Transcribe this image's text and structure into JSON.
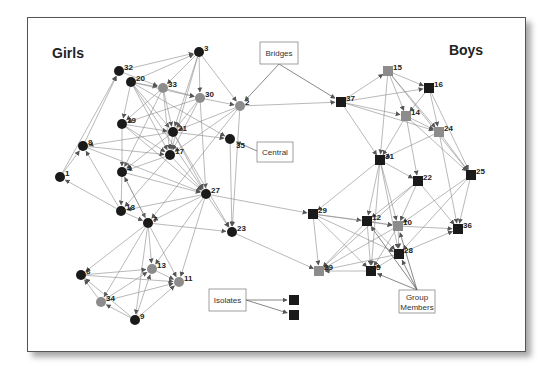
{
  "figure": {
    "groups": [
      {
        "id": "girls",
        "label": "Girls",
        "x": 68,
        "y": 58
      },
      {
        "id": "boys",
        "label": "Boys",
        "x": 466,
        "y": 55
      }
    ],
    "colors": {
      "member_dark": "#1a1a1a",
      "member_gray": "#8c8c8c",
      "edge": "#8a8a8a"
    },
    "legend_note": "Circles = girls, squares = boys; gray fill = group members",
    "nodes": [
      {
        "id": "3",
        "label": "3",
        "shape": "circle",
        "fill": "dark",
        "x": 199,
        "y": 52
      },
      {
        "id": "32",
        "label": "32",
        "shape": "circle",
        "fill": "dark",
        "x": 119,
        "y": 71
      },
      {
        "id": "20",
        "label": "20",
        "shape": "circle",
        "fill": "dark",
        "x": 131,
        "y": 82
      },
      {
        "id": "33",
        "label": "33",
        "shape": "circle",
        "fill": "gray",
        "x": 163,
        "y": 88
      },
      {
        "id": "30",
        "label": "30",
        "shape": "circle",
        "fill": "gray",
        "x": 200,
        "y": 98
      },
      {
        "id": "2",
        "label": "2",
        "shape": "circle",
        "fill": "gray",
        "x": 240,
        "y": 106
      },
      {
        "id": "19",
        "label": "19",
        "shape": "circle",
        "fill": "dark",
        "x": 122,
        "y": 124
      },
      {
        "id": "21",
        "label": "21",
        "shape": "circle",
        "fill": "dark",
        "x": 173,
        "y": 132
      },
      {
        "id": "35",
        "label": "35",
        "shape": "circle",
        "fill": "dark",
        "x": 230,
        "y": 139,
        "label_dx": 6,
        "label_dy": 10
      },
      {
        "id": "8",
        "label": "8",
        "shape": "circle",
        "fill": "dark",
        "x": 83,
        "y": 146
      },
      {
        "id": "17",
        "label": "17",
        "shape": "circle",
        "fill": "dark",
        "x": 170,
        "y": 155
      },
      {
        "id": "4",
        "label": "4",
        "shape": "circle",
        "fill": "dark",
        "x": 122,
        "y": 172
      },
      {
        "id": "1",
        "label": "1",
        "shape": "circle",
        "fill": "dark",
        "x": 60,
        "y": 177
      },
      {
        "id": "27",
        "label": "27",
        "shape": "circle",
        "fill": "dark",
        "x": 206,
        "y": 194
      },
      {
        "id": "18",
        "label": "18",
        "shape": "circle",
        "fill": "dark",
        "x": 121,
        "y": 211
      },
      {
        "id": "7",
        "label": "7",
        "shape": "circle",
        "fill": "dark",
        "x": 148,
        "y": 223
      },
      {
        "id": "23",
        "label": "23",
        "shape": "circle",
        "fill": "dark",
        "x": 232,
        "y": 232
      },
      {
        "id": "13",
        "label": "13",
        "shape": "circle",
        "fill": "gray",
        "x": 152,
        "y": 269
      },
      {
        "id": "6",
        "label": "6",
        "shape": "circle",
        "fill": "dark",
        "x": 81,
        "y": 275
      },
      {
        "id": "11",
        "label": "11",
        "shape": "circle",
        "fill": "gray",
        "x": 179,
        "y": 282
      },
      {
        "id": "34",
        "label": "34",
        "shape": "circle",
        "fill": "gray",
        "x": 101,
        "y": 302
      },
      {
        "id": "9",
        "label": "9",
        "shape": "circle",
        "fill": "dark",
        "x": 135,
        "y": 320
      },
      {
        "id": "15",
        "label": "15",
        "shape": "square",
        "fill": "gray",
        "x": 388,
        "y": 71
      },
      {
        "id": "16",
        "label": "16",
        "shape": "square",
        "fill": "dark",
        "x": 429,
        "y": 88
      },
      {
        "id": "37",
        "label": "37",
        "shape": "square",
        "fill": "dark",
        "x": 341,
        "y": 102
      },
      {
        "id": "14",
        "label": "14",
        "shape": "square",
        "fill": "gray",
        "x": 406,
        "y": 116
      },
      {
        "id": "24",
        "label": "24",
        "shape": "square",
        "fill": "gray",
        "x": 439,
        "y": 132
      },
      {
        "id": "31",
        "label": "31",
        "shape": "square",
        "fill": "dark",
        "x": 380,
        "y": 160
      },
      {
        "id": "25",
        "label": "25",
        "shape": "square",
        "fill": "dark",
        "x": 471,
        "y": 175
      },
      {
        "id": "22",
        "label": "22",
        "shape": "square",
        "fill": "dark",
        "x": 418,
        "y": 181
      },
      {
        "id": "29",
        "label": "29",
        "shape": "square",
        "fill": "dark",
        "x": 313,
        "y": 214
      },
      {
        "id": "12",
        "label": "12",
        "shape": "square",
        "fill": "dark",
        "x": 367,
        "y": 221
      },
      {
        "id": "10",
        "label": "10",
        "shape": "square",
        "fill": "gray",
        "x": 398,
        "y": 226
      },
      {
        "id": "36",
        "label": "36",
        "shape": "square",
        "fill": "dark",
        "x": 458,
        "y": 229
      },
      {
        "id": "28",
        "label": "28",
        "shape": "square",
        "fill": "dark",
        "x": 399,
        "y": 254
      },
      {
        "id": "29b",
        "label": "29",
        "shape": "square",
        "fill": "gray",
        "x": 319,
        "y": 271
      },
      {
        "id": "5",
        "label": "5",
        "shape": "square",
        "fill": "dark",
        "x": 371,
        "y": 271
      },
      {
        "id": "iso1",
        "label": "",
        "shape": "square",
        "fill": "dark",
        "x": 294,
        "y": 300
      },
      {
        "id": "iso2",
        "label": "",
        "shape": "square",
        "fill": "dark",
        "x": 294,
        "y": 315
      }
    ],
    "edges": [
      [
        "32",
        "3"
      ],
      [
        "20",
        "3"
      ],
      [
        "3",
        "33"
      ],
      [
        "3",
        "30"
      ],
      [
        "3",
        "2"
      ],
      [
        "3",
        "21"
      ],
      [
        "3",
        "17"
      ],
      [
        "20",
        "33"
      ],
      [
        "20",
        "30"
      ],
      [
        "32",
        "33"
      ],
      [
        "20",
        "21"
      ],
      [
        "20",
        "17"
      ],
      [
        "20",
        "19"
      ],
      [
        "20",
        "35"
      ],
      [
        "20",
        "27"
      ],
      [
        "33",
        "30"
      ],
      [
        "33",
        "21"
      ],
      [
        "33",
        "17"
      ],
      [
        "33",
        "19"
      ],
      [
        "33",
        "4"
      ],
      [
        "30",
        "21"
      ],
      [
        "30",
        "17"
      ],
      [
        "30",
        "2"
      ],
      [
        "30",
        "27"
      ],
      [
        "30",
        "19"
      ],
      [
        "2",
        "21"
      ],
      [
        "2",
        "17"
      ],
      [
        "2",
        "23"
      ],
      [
        "2",
        "37"
      ],
      [
        "2",
        "7"
      ],
      [
        "19",
        "21"
      ],
      [
        "19",
        "4"
      ],
      [
        "19",
        "27"
      ],
      [
        "19",
        "17"
      ],
      [
        "21",
        "17"
      ],
      [
        "21",
        "35"
      ],
      [
        "21",
        "27"
      ],
      [
        "21",
        "8"
      ],
      [
        "21",
        "4"
      ],
      [
        "21",
        "23"
      ],
      [
        "8",
        "32"
      ],
      [
        "1",
        "32"
      ],
      [
        "1",
        "8"
      ],
      [
        "8",
        "17"
      ],
      [
        "8",
        "27"
      ],
      [
        "18",
        "8"
      ],
      [
        "17",
        "4"
      ],
      [
        "17",
        "27"
      ],
      [
        "17",
        "18"
      ],
      [
        "4",
        "18"
      ],
      [
        "4",
        "27"
      ],
      [
        "4",
        "7"
      ],
      [
        "18",
        "1"
      ],
      [
        "18",
        "7"
      ],
      [
        "35",
        "23"
      ],
      [
        "27",
        "23"
      ],
      [
        "27",
        "7"
      ],
      [
        "27",
        "13"
      ],
      [
        "27",
        "11"
      ],
      [
        "27",
        "29"
      ],
      [
        "27",
        "18"
      ],
      [
        "7",
        "23"
      ],
      [
        "7",
        "13"
      ],
      [
        "7",
        "11"
      ],
      [
        "7",
        "6"
      ],
      [
        "7",
        "34"
      ],
      [
        "7",
        "9"
      ],
      [
        "7",
        "4"
      ],
      [
        "6",
        "13"
      ],
      [
        "6",
        "11"
      ],
      [
        "34",
        "13"
      ],
      [
        "34",
        "11"
      ],
      [
        "34",
        "6"
      ],
      [
        "9",
        "34"
      ],
      [
        "9",
        "13"
      ],
      [
        "9",
        "11"
      ],
      [
        "9",
        "6"
      ],
      [
        "13",
        "11"
      ],
      [
        "23",
        "29b"
      ],
      [
        "37",
        "15"
      ],
      [
        "37",
        "16"
      ],
      [
        "37",
        "14"
      ],
      [
        "37",
        "24"
      ],
      [
        "37",
        "31"
      ],
      [
        "15",
        "16"
      ],
      [
        "15",
        "14"
      ],
      [
        "15",
        "24"
      ],
      [
        "15",
        "31"
      ],
      [
        "15",
        "25"
      ],
      [
        "16",
        "14"
      ],
      [
        "16",
        "24"
      ],
      [
        "16",
        "25"
      ],
      [
        "14",
        "24"
      ],
      [
        "14",
        "31"
      ],
      [
        "14",
        "22"
      ],
      [
        "14",
        "25"
      ],
      [
        "24",
        "31"
      ],
      [
        "24",
        "25"
      ],
      [
        "24",
        "36"
      ],
      [
        "31",
        "22"
      ],
      [
        "31",
        "12"
      ],
      [
        "31",
        "10"
      ],
      [
        "31",
        "29"
      ],
      [
        "31",
        "5"
      ],
      [
        "31",
        "28"
      ],
      [
        "22",
        "10"
      ],
      [
        "22",
        "12"
      ],
      [
        "22",
        "36"
      ],
      [
        "22",
        "29b"
      ],
      [
        "25",
        "10"
      ],
      [
        "25",
        "28"
      ],
      [
        "25",
        "36"
      ],
      [
        "29",
        "12"
      ],
      [
        "29",
        "28"
      ],
      [
        "29",
        "5"
      ],
      [
        "29",
        "29b"
      ],
      [
        "29",
        "10"
      ],
      [
        "12",
        "10"
      ],
      [
        "12",
        "5"
      ],
      [
        "12",
        "29b"
      ],
      [
        "12",
        "28"
      ],
      [
        "10",
        "36"
      ],
      [
        "10",
        "5"
      ],
      [
        "10",
        "29b"
      ],
      [
        "10",
        "28"
      ],
      [
        "28",
        "36"
      ],
      [
        "28",
        "5"
      ],
      [
        "28",
        "29b"
      ],
      [
        "5",
        "29b"
      ]
    ],
    "callouts": [
      {
        "id": "bridges",
        "label": "Bridges",
        "x": 260,
        "y": 42,
        "w": 38,
        "h": 22,
        "targets": [
          [
            240,
            106
          ],
          [
            341,
            102
          ]
        ],
        "from": [
          279,
          64
        ]
      },
      {
        "id": "central",
        "label": "Central",
        "x": 257,
        "y": 142,
        "w": 36,
        "h": 20,
        "targets": [
          [
            230,
            139
          ]
        ],
        "from": [
          257,
          151
        ]
      },
      {
        "id": "isolates",
        "label": "Isolates",
        "x": 209,
        "y": 289,
        "w": 37,
        "h": 22,
        "targets": [
          [
            294,
            300
          ],
          [
            294,
            315
          ]
        ],
        "from": [
          246,
          300
        ]
      },
      {
        "id": "group-members",
        "label_lines": [
          "Group",
          "Members"
        ],
        "x": 399,
        "y": 290,
        "w": 36,
        "h": 23,
        "targets": [
          [
            367,
            221
          ],
          [
            398,
            226
          ],
          [
            371,
            271
          ],
          [
            399,
            254
          ]
        ],
        "from": [
          417,
          290
        ]
      }
    ]
  }
}
